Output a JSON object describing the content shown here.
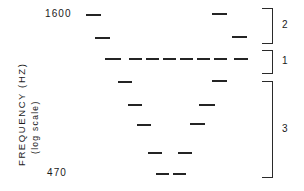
{
  "figure": {
    "axis_title": "FREQUENCY (HZ)",
    "axis_subtitle": "(log scale)",
    "tick_top": "1600",
    "tick_bottom": "470"
  },
  "brackets": [
    {
      "label": "2",
      "top": 8,
      "height": 36
    },
    {
      "label": "1",
      "top": 50,
      "height": 24
    },
    {
      "label": "3",
      "top": 81,
      "height": 97
    }
  ],
  "chart_data": {
    "type": "scatter",
    "title": "",
    "xlabel": "",
    "ylabel": "FREQUENCY (HZ)",
    "ylabel_note": "(log scale)",
    "ytick_labels": [
      "1600",
      "470"
    ],
    "ylim": [
      470,
      1600
    ],
    "grid": false,
    "legend": "none",
    "marker": "horizontal-dash",
    "annotations": [
      {
        "label": "2",
        "type": "bracket",
        "position": "right"
      },
      {
        "label": "1",
        "type": "bracket",
        "position": "right"
      },
      {
        "label": "3",
        "type": "bracket",
        "position": "right"
      }
    ],
    "groups": [
      {
        "name": "2",
        "points": [
          {
            "x": 86,
            "y": 14,
            "w": 15
          },
          {
            "x": 95,
            "y": 37,
            "w": 15
          },
          {
            "x": 212,
            "y": 13,
            "w": 15
          },
          {
            "x": 232,
            "y": 36,
            "w": 15
          }
        ]
      },
      {
        "name": "1",
        "points": [
          {
            "x": 105,
            "y": 58,
            "w": 16
          },
          {
            "x": 129,
            "y": 58,
            "w": 13
          },
          {
            "x": 146,
            "y": 58,
            "w": 13
          },
          {
            "x": 163,
            "y": 58,
            "w": 13
          },
          {
            "x": 180,
            "y": 58,
            "w": 13
          },
          {
            "x": 197,
            "y": 58,
            "w": 13
          },
          {
            "x": 214,
            "y": 58,
            "w": 13
          },
          {
            "x": 234,
            "y": 58,
            "w": 14
          }
        ]
      },
      {
        "name": "3",
        "points": [
          {
            "x": 118,
            "y": 81,
            "w": 14
          },
          {
            "x": 212,
            "y": 80,
            "w": 15
          },
          {
            "x": 128,
            "y": 104,
            "w": 14
          },
          {
            "x": 199,
            "y": 104,
            "w": 16
          },
          {
            "x": 137,
            "y": 124,
            "w": 14
          },
          {
            "x": 190,
            "y": 123,
            "w": 15
          },
          {
            "x": 148,
            "y": 152,
            "w": 14
          },
          {
            "x": 178,
            "y": 152,
            "w": 14
          },
          {
            "x": 156,
            "y": 173,
            "w": 13
          },
          {
            "x": 173,
            "y": 173,
            "w": 13
          }
        ]
      }
    ]
  }
}
